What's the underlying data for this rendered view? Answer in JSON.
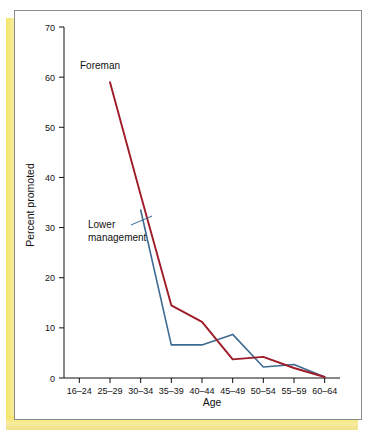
{
  "figure": {
    "panel_background": "#ffffff",
    "frame_color": "#8a8a8a",
    "accent_strip_color": "#f5e469"
  },
  "chart_data": {
    "type": "line",
    "title": "",
    "subtitle": "",
    "xlabel": "Age",
    "ylabel": "Percent promoted",
    "categories": [
      "16–24",
      "25–29",
      "30–34",
      "35–39",
      "40–44",
      "45–49",
      "50–54",
      "55–59",
      "60–64"
    ],
    "ylim": [
      0,
      70
    ],
    "yticks": [
      0,
      10,
      20,
      30,
      40,
      50,
      60,
      70
    ],
    "ytick_labels": [
      "0",
      "10",
      "20",
      "30",
      "40",
      "50",
      "60",
      "70"
    ],
    "grid": false,
    "legend_position": "inline-annotation",
    "series": [
      {
        "name": "Foreman",
        "color": "#9e1b28",
        "x": [
          "25–29",
          "30–34",
          "35–39",
          "40–44",
          "45–49",
          "50–54",
          "55–59",
          "60–64"
        ],
        "values": [
          59,
          36.5,
          14.5,
          11.2,
          3.7,
          4.2,
          2.0,
          0.2
        ]
      },
      {
        "name": "Lower management",
        "color": "#3d6b92",
        "x": [
          "30–34",
          "35–39",
          "40–44",
          "45–49",
          "50–54",
          "55–59",
          "60–64"
        ],
        "values": [
          33.5,
          6.6,
          6.6,
          8.7,
          2.2,
          2.7,
          0.2
        ]
      }
    ],
    "annotations": [
      {
        "text": "Foreman",
        "series": "Foreman"
      },
      {
        "text": "Lower",
        "series": "Lower management"
      },
      {
        "text": "management",
        "series": "Lower management"
      }
    ]
  }
}
